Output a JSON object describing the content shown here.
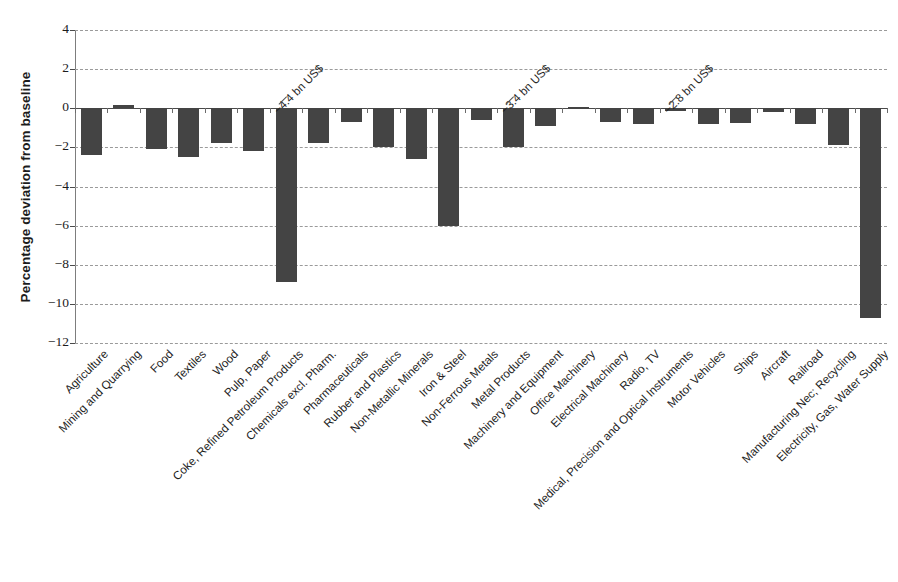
{
  "chart_data": {
    "type": "bar",
    "title": "",
    "xlabel": "",
    "ylabel": "Percentage deviation from baseline",
    "ylim": [
      -12,
      4
    ],
    "yticks": [
      4,
      2,
      0,
      -2,
      -4,
      -6,
      -8,
      -10,
      -12
    ],
    "ytick_labels": [
      "4",
      "2",
      "0",
      "−2",
      "−4",
      "−6",
      "−8",
      "−10",
      "−12"
    ],
    "grid": true,
    "legend": "none",
    "bar_color": "#444444",
    "categories": [
      "Agriculture",
      "Mining and Quarrying",
      "Food",
      "Textiles",
      "Wood",
      "Pulp, Paper",
      "Coke, Refined Petroleum Products",
      "Chemicals excl. Pharm.",
      "Pharmaceuticals",
      "Rubber and Plastics",
      "Non-Metallic Minerals",
      "Iron & Steel",
      "Non-Ferrous Metals",
      "Metal Products",
      "Machinery and Equipment",
      "Office Machinery",
      "Electrical Machinery",
      "Radio, TV",
      "Medical, Precision and Optical Instruments",
      "Motor Vehicles",
      "Ships",
      "Aircraft",
      "Railroad",
      "Manufacturing Nec; Recycling",
      "Electricity, Gas, Water Supply"
    ],
    "values": [
      -2.4,
      0.15,
      -2.1,
      -2.5,
      -1.8,
      -2.2,
      -8.9,
      -1.8,
      -0.7,
      -2.0,
      -2.6,
      -6.0,
      -0.6,
      -2.0,
      -0.9,
      0.08,
      -0.7,
      -0.8,
      -0.15,
      -0.8,
      -0.75,
      -0.2,
      -0.8,
      -1.9,
      -10.7
    ],
    "annotations": [
      {
        "text": "−4.4 bn US$",
        "category_index": 6
      },
      {
        "text": "−3.4 bn US$",
        "category_index": 13
      },
      {
        "text": "−2.8 bn US$",
        "category_index": 18
      }
    ]
  }
}
